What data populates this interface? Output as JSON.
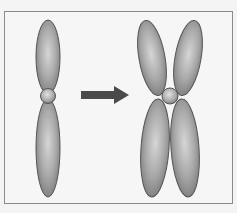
{
  "diagram": {
    "colors": {
      "background": "#f4f4f4",
      "frame_border": "#8a8a8a",
      "chromatid_light": "#cfcfcf",
      "chromatid_mid": "#a9a9a9",
      "chromatid_dark": "#777777",
      "outline": "#555555",
      "centromere": "#b8b8b8",
      "arrow": "#4a4a4a"
    },
    "elements": [
      {
        "name": "unreplicated-chromosome",
        "label": ""
      },
      {
        "name": "process-arrow",
        "label": ""
      },
      {
        "name": "replicated-chromosome",
        "label": ""
      }
    ]
  }
}
